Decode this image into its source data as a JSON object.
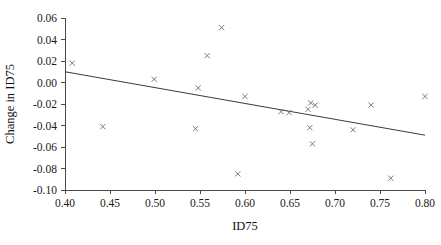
{
  "chart_data": {
    "type": "scatter",
    "title": "",
    "xlabel": "ID75",
    "ylabel": "Change in ID75",
    "xlim": [
      0.4,
      0.8
    ],
    "ylim": [
      -0.1,
      0.06
    ],
    "xticks": [
      "0.40",
      "0.45",
      "0.50",
      "0.55",
      "0.60",
      "0.65",
      "0.70",
      "0.75",
      "0.80"
    ],
    "xtick_values": [
      0.4,
      0.45,
      0.5,
      0.55,
      0.6,
      0.65,
      0.7,
      0.75,
      0.8
    ],
    "yticks": [
      "0.06",
      "0.04",
      "0.02",
      "0.00",
      "-0.02",
      "-0.04",
      "-0.06",
      "-0.08",
      "-0.10"
    ],
    "ytick_values": [
      0.06,
      0.04,
      0.02,
      0.0,
      -0.02,
      -0.04,
      -0.06,
      -0.08,
      -0.1
    ],
    "grid": false,
    "legend": false,
    "marker": "x",
    "marker_color": "#6b6b6b",
    "line_color": "#3a3a3a",
    "points": [
      {
        "x": 0.408,
        "y": 0.018
      },
      {
        "x": 0.442,
        "y": -0.041
      },
      {
        "x": 0.499,
        "y": 0.003
      },
      {
        "x": 0.545,
        "y": -0.043
      },
      {
        "x": 0.548,
        "y": -0.005
      },
      {
        "x": 0.558,
        "y": 0.025
      },
      {
        "x": 0.574,
        "y": 0.051
      },
      {
        "x": 0.592,
        "y": -0.085
      },
      {
        "x": 0.6,
        "y": -0.013
      },
      {
        "x": 0.64,
        "y": -0.027
      },
      {
        "x": 0.649,
        "y": -0.028
      },
      {
        "x": 0.67,
        "y": -0.025
      },
      {
        "x": 0.672,
        "y": -0.042
      },
      {
        "x": 0.673,
        "y": -0.019
      },
      {
        "x": 0.675,
        "y": -0.057
      },
      {
        "x": 0.678,
        "y": -0.021
      },
      {
        "x": 0.72,
        "y": -0.044
      },
      {
        "x": 0.74,
        "y": -0.021
      },
      {
        "x": 0.762,
        "y": -0.089
      },
      {
        "x": 0.8,
        "y": -0.013
      }
    ],
    "trendline": {
      "x_start": 0.4,
      "y_start": 0.01,
      "x_end": 0.8,
      "y_end": -0.049
    }
  }
}
